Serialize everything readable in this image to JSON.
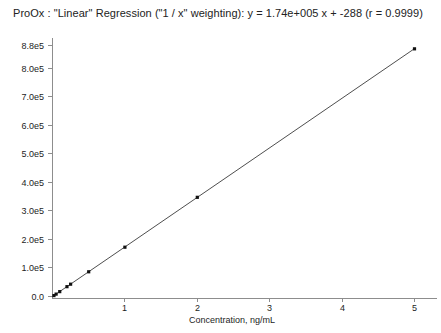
{
  "chart_data": {
    "type": "scatter",
    "title": "ProOx : \"Linear\" Regression (\"1 / x\" weighting): y = 1.74e+005 x + -288 (r = 0.9999)",
    "xlabel": "Concentration, ng/mL",
    "ylabel": "",
    "xlim": [
      0,
      5.35
    ],
    "ylim": [
      0,
      880000
    ],
    "grid": false,
    "legend": null,
    "regression": {
      "slope": 174000,
      "intercept": -288,
      "r": 0.9999,
      "weighting": "1 / x",
      "model": "Linear",
      "analyte": "ProOx",
      "equation": "y = 1.74e+005 x + -288"
    },
    "x_ticks": [
      1,
      2,
      3,
      4,
      5
    ],
    "x_tick_labels": [
      "1",
      "2",
      "3",
      "4",
      "5"
    ],
    "y_ticks": [
      0,
      100000,
      200000,
      300000,
      400000,
      500000,
      600000,
      700000,
      800000,
      880000
    ],
    "y_tick_labels": [
      "0.0",
      "1.0e5",
      "2.0e5",
      "3.0e5",
      "4.0e5",
      "5.0e5",
      "6.0e5",
      "7.0e5",
      "8.0e5",
      "8.8e5"
    ],
    "series": [
      {
        "name": "Calibration standards",
        "x": [
          0.02,
          0.05,
          0.1,
          0.2,
          0.25,
          0.5,
          1.0,
          2.0,
          5.0
        ],
        "y": [
          3200,
          8400,
          17100,
          34500,
          43200,
          86700,
          173000,
          348000,
          869000
        ]
      }
    ],
    "fit_line": {
      "x": [
        0.0,
        5.0
      ],
      "y": [
        0,
        869712
      ]
    }
  },
  "colors": {
    "background": "#ffffff",
    "axis": "#8d8d8d",
    "line": "#3a3a3a",
    "marker": "#111111",
    "text": "#1d1d1d"
  }
}
